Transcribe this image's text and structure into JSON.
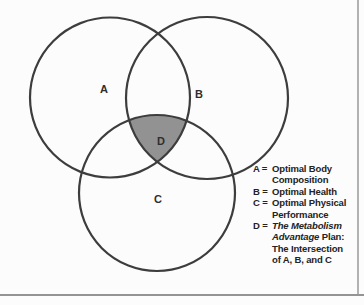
{
  "figure": {
    "type": "venn-diagram",
    "background": "#fcfcfc",
    "circle_stroke_color": "#3d3d3d",
    "intersection_fill_color": "#929292",
    "labels": {
      "a": "A",
      "b": "B",
      "c": "C",
      "d": "D"
    }
  },
  "legend": {
    "items": [
      {
        "key": "A",
        "equals": "=",
        "segments": [
          {
            "text": "Optimal Body Composition",
            "italic": false
          }
        ]
      },
      {
        "key": "B",
        "equals": "=",
        "segments": [
          {
            "text": "Optimal Health",
            "italic": false
          }
        ]
      },
      {
        "key": "C",
        "equals": "=",
        "segments": [
          {
            "text": "Optimal Physical Performance",
            "italic": false
          }
        ]
      },
      {
        "key": "D",
        "equals": "=",
        "segments": [
          {
            "text": "The Metabolism Advantage",
            "italic": true
          },
          {
            "text": " Plan: The Intersection of A, B, and C",
            "italic": false
          }
        ]
      }
    ]
  }
}
